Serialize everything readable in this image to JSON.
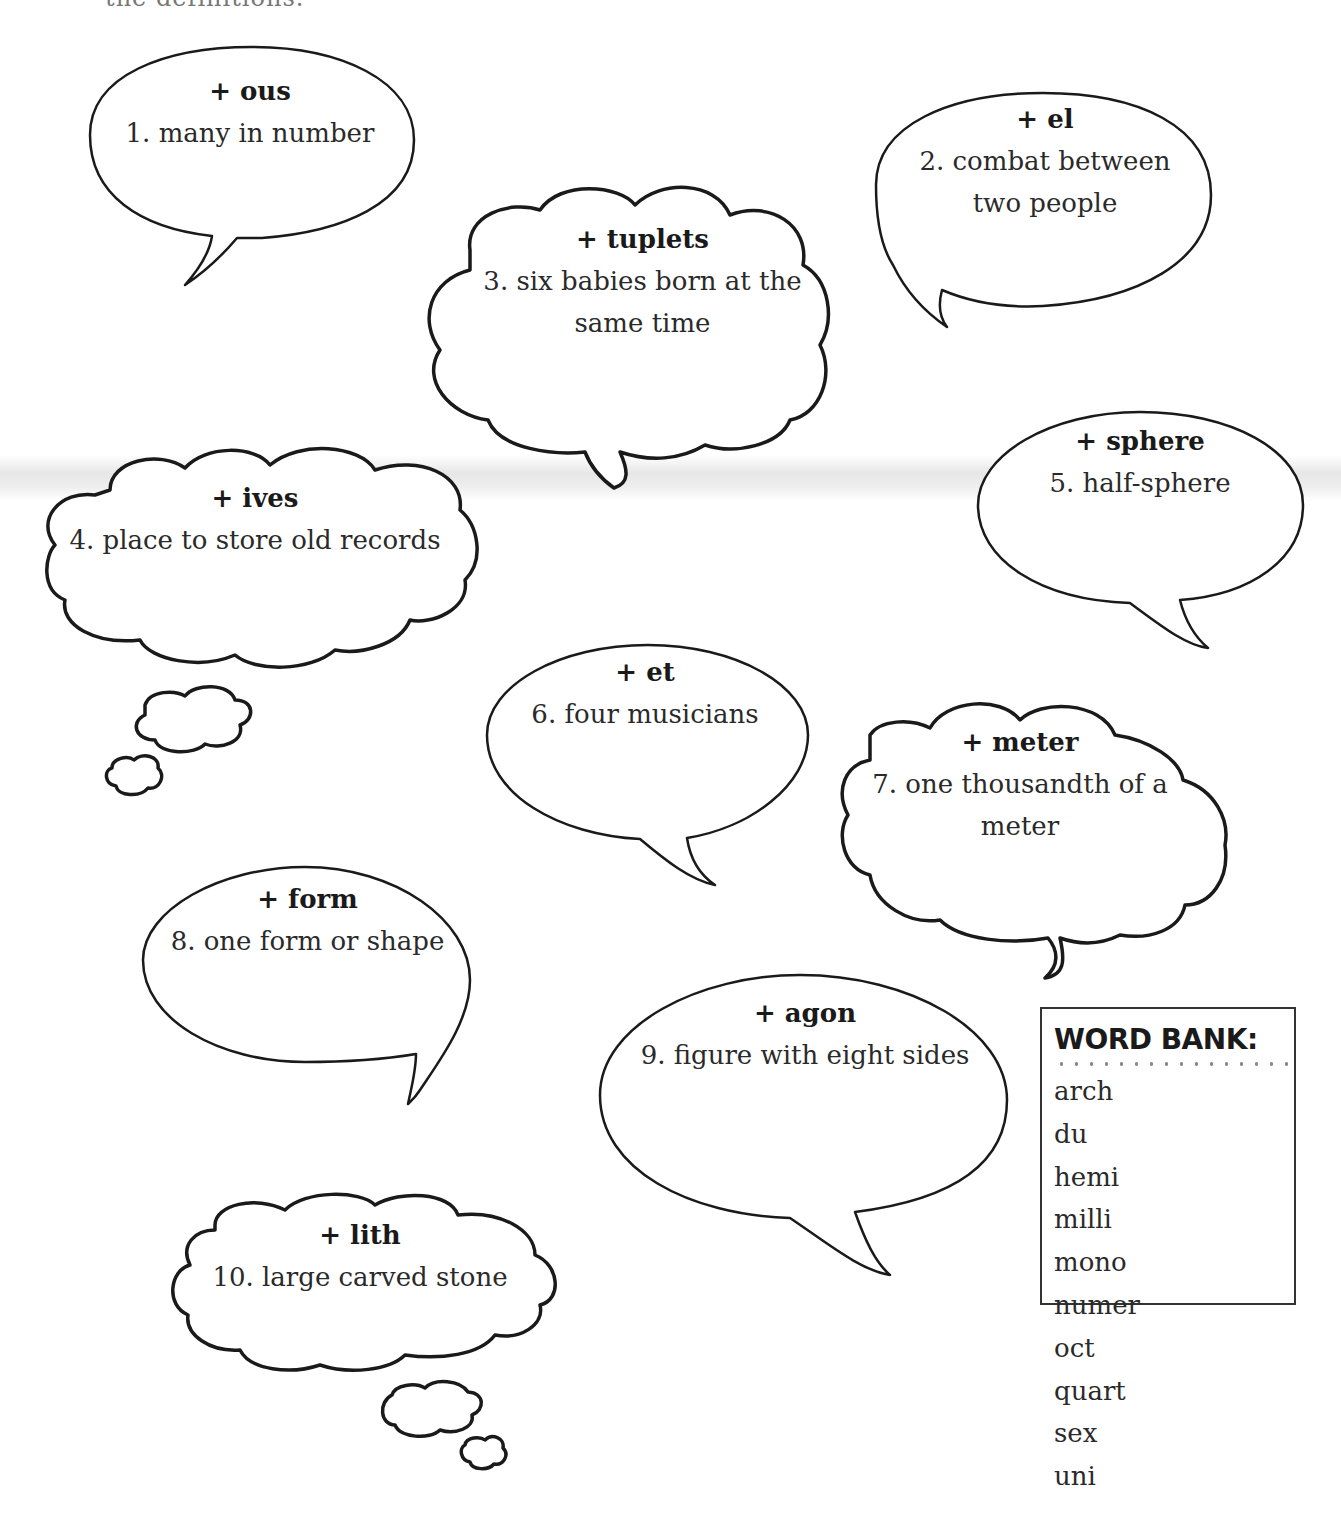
{
  "page": {
    "top_cut_text": "the definitions."
  },
  "bubbles": [
    {
      "number": 1,
      "suffix": "+ ous",
      "clue": "1. many in number",
      "shape": "speech-oval"
    },
    {
      "number": 2,
      "suffix": "+ el",
      "clue_line1": "2. combat between",
      "clue_line2": "two people",
      "shape": "speech-oval"
    },
    {
      "number": 3,
      "suffix": "+ tuplets",
      "clue_line1": "3. six babies born at the",
      "clue_line2": "same time",
      "shape": "speech-cloud"
    },
    {
      "number": 4,
      "suffix": "+ ives",
      "clue": "4. place to store old records",
      "shape": "thought-cloud"
    },
    {
      "number": 5,
      "suffix": "+ sphere",
      "clue": "5. half-sphere",
      "shape": "speech-oval"
    },
    {
      "number": 6,
      "suffix": "+ et",
      "clue": "6. four musicians",
      "shape": "speech-oval"
    },
    {
      "number": 7,
      "suffix": "+ meter",
      "clue_line1": "7. one thousandth of a",
      "clue_line2": "meter",
      "shape": "speech-cloud"
    },
    {
      "number": 8,
      "suffix": "+ form",
      "clue": "8. one form or shape",
      "shape": "speech-oval"
    },
    {
      "number": 9,
      "suffix": "+ agon",
      "clue": "9. figure with eight sides",
      "shape": "speech-oval"
    },
    {
      "number": 10,
      "suffix": "+ lith",
      "clue": "10. large carved stone",
      "shape": "thought-cloud"
    }
  ],
  "word_bank": {
    "title": "WORD BANK:",
    "words": [
      "arch",
      "du",
      "hemi",
      "milli",
      "mono",
      "numer",
      "oct",
      "quart",
      "sex",
      "uni"
    ]
  }
}
